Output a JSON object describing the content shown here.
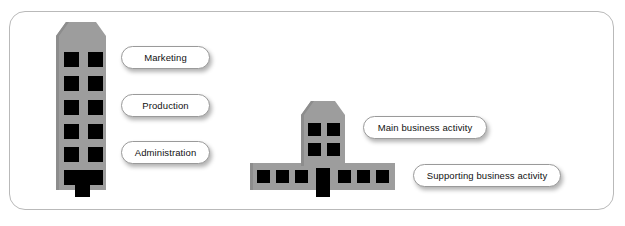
{
  "figure": {
    "name": "business-activity-building-diagram",
    "frame": {
      "border_color": "#b9b9b9",
      "background": "#ffffff"
    }
  },
  "colors": {
    "building_fill": "#9d9d9d",
    "building_shade": "#8f8f8f",
    "window_fill": "#000000",
    "pill_border": "#9a9a9a",
    "pill_fill": "#ffffff",
    "text": "#111111",
    "frame_border": "#b9b9b9"
  },
  "buildings": [
    {
      "id": "tall-office-tower",
      "name": "tall-office-building",
      "floors": 6,
      "windows_per_floor": 2,
      "has_door": true,
      "door_position": "center"
    },
    {
      "id": "main-and-support-building",
      "name": "main-business-building",
      "tower_floors": 2,
      "tower_windows_per_floor": 2,
      "base_windows_left": 3,
      "base_windows_right": 3,
      "has_door": true,
      "door_position": "center"
    }
  ],
  "labels": {
    "marketing": "Marketing",
    "production": "Production",
    "administration": "Administration",
    "main_business_activity": "Main business activity",
    "supporting_business_activity": "Supporting business activity"
  }
}
